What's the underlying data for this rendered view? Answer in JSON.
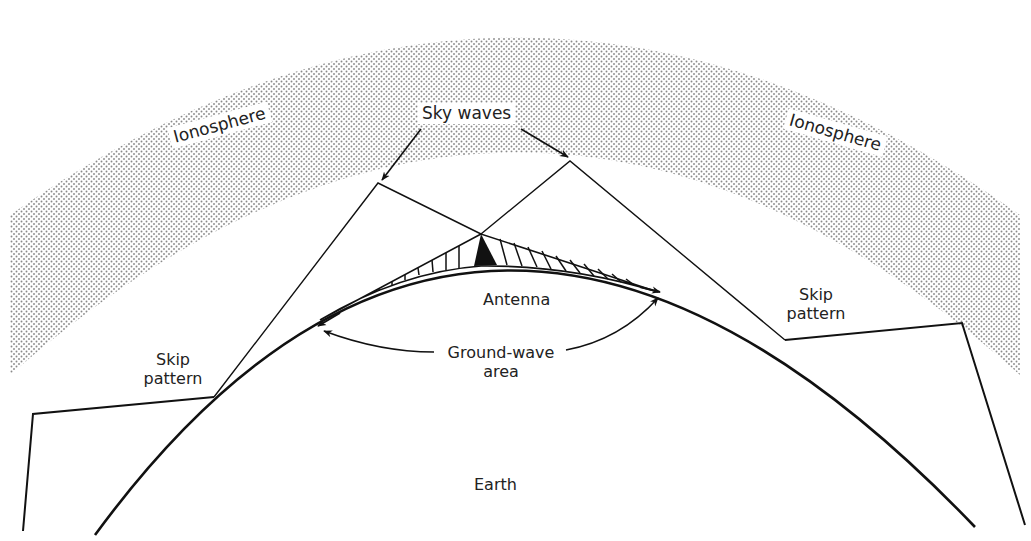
{
  "diagram": {
    "title_partial": "",
    "colors": {
      "ink": "#111111",
      "stipple": "#8a8a8a",
      "paper": "#ffffff"
    },
    "labels": {
      "ionosphere_left": "Ionosphere",
      "ionosphere_right": "Ionosphere",
      "sky_waves": "Sky waves",
      "antenna": "Antenna",
      "ground_wave_line1": "Ground-wave",
      "ground_wave_line2": "area",
      "skip_left_line1": "Skip",
      "skip_left_line2": "pattern",
      "skip_right_line1": "Skip",
      "skip_right_line2": "pattern",
      "earth": "Earth"
    }
  }
}
